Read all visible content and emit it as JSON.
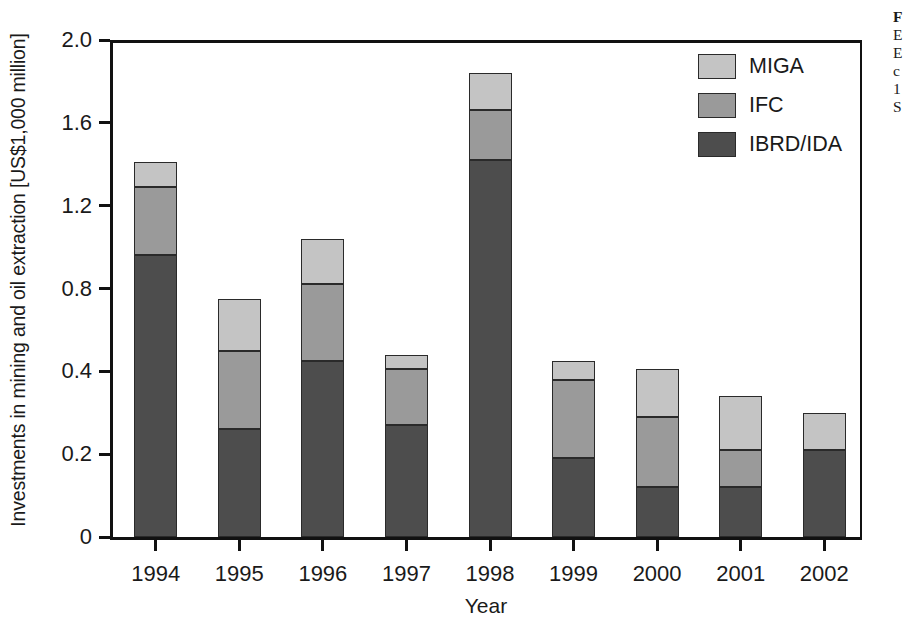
{
  "chart_data": {
    "type": "bar",
    "subtype": "stacked-bar",
    "title": "",
    "xlabel": "Year",
    "ylabel": "Investments in mining and oil extraction [US$1,000 million]",
    "categories": [
      "1994",
      "1995",
      "1996",
      "1997",
      "1998",
      "1999",
      "2000",
      "2001",
      "2002"
    ],
    "series": [
      {
        "name": "IBRD/IDA",
        "color": "#4d4d4d",
        "values": [
          0.96,
          0.26,
          0.45,
          0.27,
          1.42,
          0.19,
          0.12,
          0.12,
          0.21
        ]
      },
      {
        "name": "IFC",
        "color": "#9a9a9a",
        "values": [
          0.33,
          0.24,
          0.37,
          0.14,
          0.24,
          0.19,
          0.17,
          0.09,
          0.0
        ]
      },
      {
        "name": "MIGA",
        "color": "#c4c4c4",
        "values": [
          0.12,
          0.25,
          0.22,
          0.07,
          0.18,
          0.07,
          0.12,
          0.13,
          0.09
        ]
      }
    ],
    "totals": [
      1.41,
      0.75,
      1.04,
      0.48,
      1.84,
      0.45,
      0.41,
      0.34,
      0.3
    ],
    "ytick_labels": [
      "0",
      "0.2",
      "0.4",
      "0.8",
      "1.2",
      "1.6",
      "2.0"
    ],
    "ytick_values": [
      0,
      0.2,
      0.4,
      0.8,
      1.2,
      1.6,
      2.0
    ],
    "ylim": [
      0,
      2.0
    ],
    "grid": false,
    "legend_position": "top-right",
    "legend_order": [
      "MIGA",
      "IFC",
      "IBRD/IDA"
    ]
  },
  "legend": {
    "items": [
      {
        "label": "MIGA",
        "color": "#c4c4c4"
      },
      {
        "label": "IFC",
        "color": "#9a9a9a"
      },
      {
        "label": "IBRD/IDA",
        "color": "#4d4d4d"
      }
    ]
  },
  "axes": {
    "y_title": "Investments in mining and oil extraction [US$1,000 million]",
    "x_title": "Year"
  },
  "side_caption": {
    "lines": [
      "F",
      "E",
      "E",
      "c",
      "1",
      "S"
    ]
  }
}
